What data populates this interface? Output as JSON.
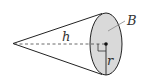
{
  "figure": {
    "type": "cone-diagram",
    "labels": {
      "height": "h",
      "radius": "r",
      "base": "B"
    },
    "colors": {
      "stroke": "#222222",
      "base_fill": "#d9d9d9",
      "label": "#333333",
      "leader": "#888888"
    }
  }
}
